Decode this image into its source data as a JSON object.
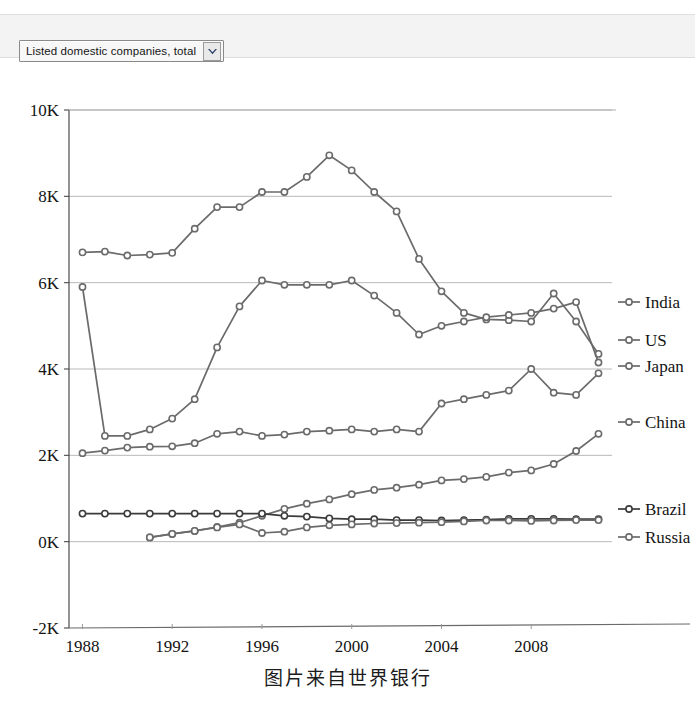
{
  "selector": {
    "value": "Listed domestic companies, total",
    "arrow_icon": "chevron-down-icon"
  },
  "caption": "图片来自世界银行",
  "chart_data": {
    "type": "line",
    "title": "",
    "xlabel": "",
    "ylabel": "",
    "grid": true,
    "legend_position": "right",
    "xlim": [
      1987.4,
      2011.6
    ],
    "ylim": [
      -2000,
      10000
    ],
    "x_ticks": [
      1988,
      1992,
      1996,
      2000,
      2004,
      2008
    ],
    "x_tick_labels": [
      "1988",
      "1992",
      "1996",
      "2000",
      "2004",
      "2008"
    ],
    "y_ticks": [
      -2000,
      0,
      2000,
      4000,
      6000,
      8000,
      10000
    ],
    "y_tick_labels": [
      "-2K",
      "0K",
      "2K",
      "4K",
      "6K",
      "8K",
      "10K"
    ],
    "x": [
      1988,
      1989,
      1990,
      1991,
      1992,
      1993,
      1994,
      1995,
      1996,
      1997,
      1998,
      1999,
      2000,
      2001,
      2002,
      2003,
      2004,
      2005,
      2006,
      2007,
      2008,
      2009,
      2010,
      2011
    ],
    "series": [
      {
        "name": "India",
        "color": "#6b6b6b",
        "values": [
          2050,
          2110,
          2180,
          2200,
          2210,
          2280,
          2500,
          2550,
          2450,
          2480,
          2550,
          2570,
          2600,
          2550,
          2600,
          2550,
          3200,
          3300,
          3400,
          3500,
          4000,
          3450,
          3400,
          3900
        ]
      },
      {
        "name": "US",
        "color": "#6b6b6b",
        "values": [
          6700,
          6720,
          6630,
          6650,
          6690,
          7250,
          7750,
          7750,
          8100,
          8100,
          8450,
          8950,
          8600,
          8100,
          7650,
          6550,
          5800,
          5300,
          5150,
          5130,
          5100,
          5750,
          5100,
          4350
        ]
      },
      {
        "name": "Japan",
        "color": "#6b6b6b",
        "values": [
          5900,
          2450,
          2450,
          2600,
          2850,
          3300,
          4500,
          5450,
          6050,
          5950,
          5950,
          5950,
          6050,
          5700,
          5300,
          4800,
          5000,
          5100,
          5200,
          5250,
          5300,
          5400,
          5550,
          4150
        ]
      },
      {
        "name": "China",
        "color": "#6b6b6b",
        "values": [
          null,
          null,
          null,
          100,
          180,
          250,
          340,
          440,
          600,
          760,
          880,
          980,
          1100,
          1200,
          1250,
          1320,
          1420,
          1450,
          1500,
          1600,
          1650,
          1800,
          2100,
          2500
        ]
      },
      {
        "name": "Brazil",
        "color": "#3b3b3b",
        "values": [
          650,
          650,
          650,
          650,
          650,
          650,
          650,
          650,
          650,
          600,
          580,
          540,
          520,
          520,
          500,
          500,
          490,
          500,
          510,
          530,
          530,
          530,
          520,
          520
        ]
      },
      {
        "name": "Russia",
        "color": "#6b6b6b",
        "values": [
          null,
          null,
          null,
          100,
          180,
          250,
          330,
          400,
          200,
          230,
          330,
          380,
          400,
          420,
          430,
          440,
          450,
          470,
          490,
          490,
          480,
          490,
          500,
          500
        ]
      }
    ]
  },
  "legend": [
    {
      "label": "India",
      "y": 302
    },
    {
      "label": "US",
      "y": 340
    },
    {
      "label": "Japan",
      "y": 366
    },
    {
      "label": "China",
      "y": 422
    },
    {
      "label": "Brazil",
      "y": 509
    },
    {
      "label": "Russia",
      "y": 537
    }
  ]
}
